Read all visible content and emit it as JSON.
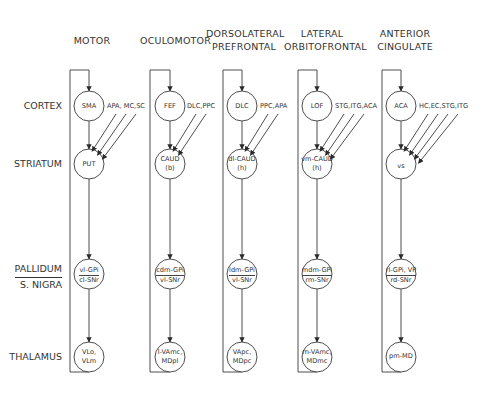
{
  "columns": [
    {
      "title": [
        "MOTOR"
      ],
      "cortex": [
        "SMA"
      ],
      "inputs": "APA, MC,SC",
      "striatum": [
        "PUT"
      ],
      "pallidum": {
        "gpi": "vl-GPi",
        "snr": "cl-SNr"
      },
      "thalamus": [
        "VLo,",
        "VLm"
      ]
    },
    {
      "title": [
        "OCULOMOTOR"
      ],
      "cortex": [
        "FEF"
      ],
      "inputs": "DLC,PPC",
      "striatum": [
        "CAUD",
        "(b)"
      ],
      "pallidum": {
        "gpi": "cdm-GPi",
        "snr": "vl-SNr"
      },
      "thalamus": [
        "l-VAmc,",
        "MDpl"
      ]
    },
    {
      "title": [
        "DORSOLATERAL",
        "PREFRONTAL"
      ],
      "cortex": [
        "DLC"
      ],
      "inputs": "PPC,APA",
      "striatum": [
        "dl-CAUD",
        "(h)"
      ],
      "pallidum": {
        "gpi": "ldm-GPi",
        "snr": "vl-SNr"
      },
      "thalamus": [
        "VApc,",
        "MDpc"
      ]
    },
    {
      "title": [
        "LATERAL",
        "ORBITOFRONTAL"
      ],
      "cortex": [
        "LOF"
      ],
      "inputs": "STG,ITG,ACA",
      "striatum": [
        "vm-CAUD",
        "(h)"
      ],
      "pallidum": {
        "gpi": "mdm-GPi",
        "snr": "rm-SNr"
      },
      "thalamus": [
        "m-VAmc,",
        "MDmc"
      ]
    },
    {
      "title": [
        "ANTERIOR",
        "CINGULATE"
      ],
      "cortex": [
        "ACA"
      ],
      "inputs": "HC,EC,STG,ITG",
      "striatum": [
        "vs"
      ],
      "pallidum": {
        "gpi": "rl-GPi, VP",
        "snr": "rd-SNr"
      },
      "thalamus": [
        "pm-MD"
      ]
    }
  ],
  "rows": {
    "cortex": "CORTEX",
    "striatum": "STRIATUM",
    "pallidum_top": "PALLIDUM",
    "pallidum_bottom": "S. NIGRA",
    "thalamus": "THALAMUS"
  },
  "colors": {
    "line": "#3a3a3a",
    "text": "#333333",
    "background": "#ffffff"
  }
}
